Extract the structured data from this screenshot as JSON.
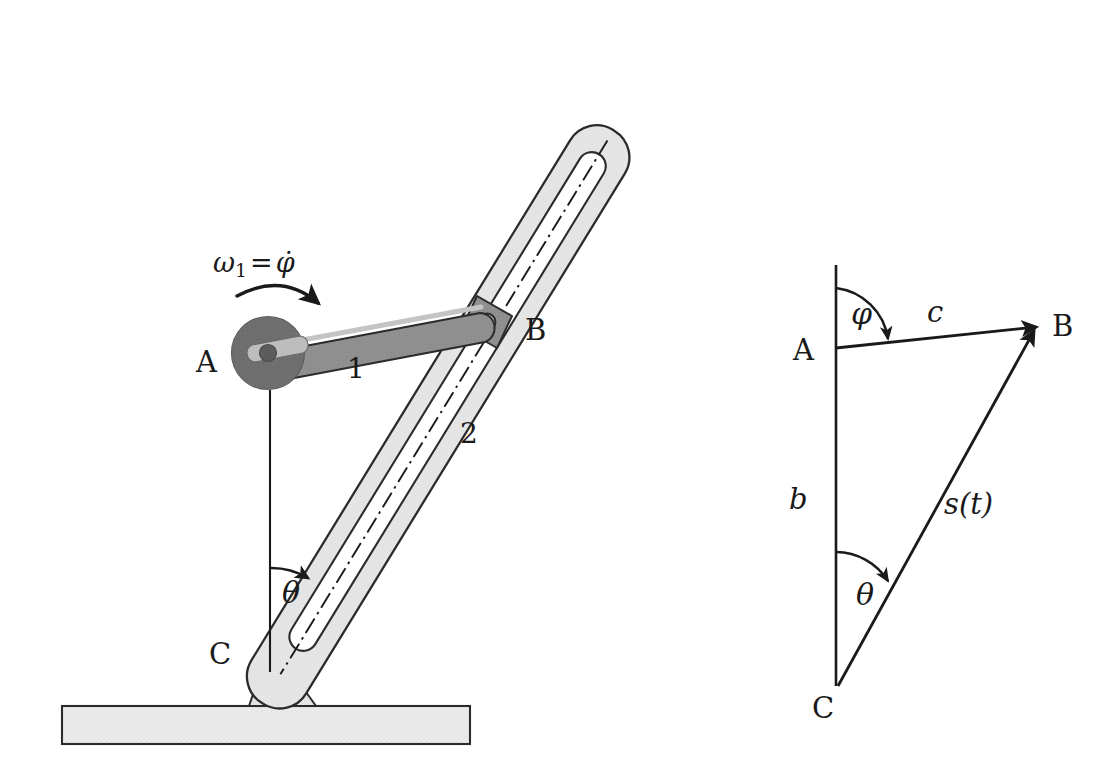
{
  "figure": {
    "background_color": "#ffffff",
    "ink_color": "#1a1a1a"
  },
  "colors": {
    "ink": "#1a1a1a",
    "outline": "#2b2b2b",
    "disk_fill": "#6e6e6e",
    "crank_fill": "#8c8c8c",
    "crank_highlight": "#b8b8b8",
    "link_fill": "#e3e3e3",
    "slider_block_fill": "#9a9a9a",
    "ground_fill": "#e8e8e8",
    "bracket_fill": "#ededed"
  },
  "mechanism": {
    "name": "slotted-link-mechanism",
    "labels": {
      "point_a": "A",
      "point_b": "B",
      "point_c": "C",
      "link_1": "1",
      "link_2": "2",
      "theta": "θ",
      "omega_symbol": "ω",
      "omega_subscript": "1",
      "omega_equals": "=",
      "omega_value": "φ̇"
    },
    "parts": [
      {
        "name": "drive-disk",
        "label": "A",
        "description": "dark grey driving disk at pivot A"
      },
      {
        "name": "crank-link-1",
        "label": "1",
        "description": "crank arm from A to slider block B"
      },
      {
        "name": "slider-block-b",
        "label": "B",
        "description": "sliding block riding in the slot of link 2"
      },
      {
        "name": "slotted-link-2",
        "label": "2",
        "description": "slotted rocker link pivoted at C"
      },
      {
        "name": "ground-pivot-c",
        "label": "C",
        "description": "fixed pivot bracket at C on the ground bar"
      },
      {
        "name": "ground-bar",
        "label": "",
        "description": "hatched fixed ground bar"
      }
    ]
  },
  "vector_triangle": {
    "name": "vector-closure-triangle",
    "labels": {
      "point_a": "A",
      "point_b": "B",
      "point_c": "C",
      "side_c": "c",
      "side_b": "b",
      "side_s": "s(t)",
      "angle_phi": "φ",
      "angle_theta": "θ"
    },
    "vectors": [
      {
        "name": "vector-c",
        "from": "A",
        "to": "B",
        "label": "c",
        "arrow": true
      },
      {
        "name": "vector-b",
        "from": "A",
        "to": "C",
        "label": "b",
        "arrow": false
      },
      {
        "name": "vector-s",
        "from": "C",
        "to": "B",
        "label": "s(t)",
        "arrow": true
      }
    ],
    "angles": [
      {
        "name": "angle-phi",
        "label": "φ",
        "vertex": "A",
        "from": "vertical-up",
        "to": "vector-c"
      },
      {
        "name": "angle-theta",
        "label": "θ",
        "vertex": "C",
        "from": "vertical-up",
        "to": "vector-s"
      }
    ]
  }
}
